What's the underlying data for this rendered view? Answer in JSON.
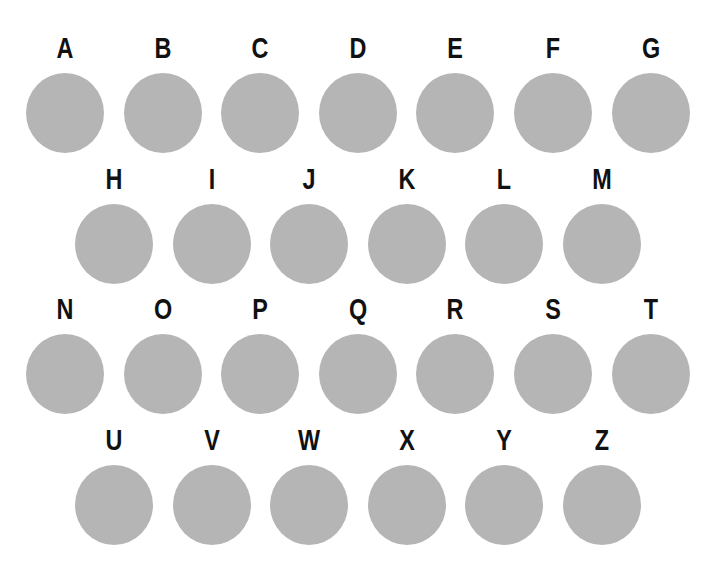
{
  "colors": {
    "circle": "#b5b5b5",
    "letter": "#111111",
    "background": "#ffffff"
  },
  "rows": [
    {
      "letters": [
        "A",
        "B",
        "C",
        "D",
        "E",
        "F",
        "G"
      ]
    },
    {
      "letters": [
        "H",
        "I",
        "J",
        "K",
        "L",
        "M"
      ]
    },
    {
      "letters": [
        "N",
        "O",
        "P",
        "Q",
        "R",
        "S",
        "T"
      ]
    },
    {
      "letters": [
        "U",
        "V",
        "W",
        "X",
        "Y",
        "Z"
      ]
    }
  ]
}
